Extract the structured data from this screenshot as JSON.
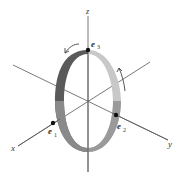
{
  "diagram": {
    "type": "3d-coordinate-axes-with-rotating-band",
    "axes": [
      {
        "name": "x",
        "label": "x"
      },
      {
        "name": "y",
        "label": "y"
      },
      {
        "name": "z",
        "label": "z"
      }
    ],
    "points": [
      {
        "name": "e1",
        "base": "e",
        "sub": "1"
      },
      {
        "name": "e2",
        "base": "e",
        "sub": "2"
      },
      {
        "name": "e3",
        "base": "e",
        "sub": "3"
      }
    ],
    "band": {
      "dark_color": "#555555",
      "light_color": "#c8c8c8",
      "mid_color": "#8a8a8a"
    },
    "arrows": [
      {
        "name": "rotation-arrow-left",
        "direction": "counterclockwise"
      },
      {
        "name": "rotation-arrow-right",
        "direction": "upward"
      }
    ],
    "colors": {
      "axis": "#555555",
      "dot": "#111111",
      "text": "#333333"
    }
  }
}
